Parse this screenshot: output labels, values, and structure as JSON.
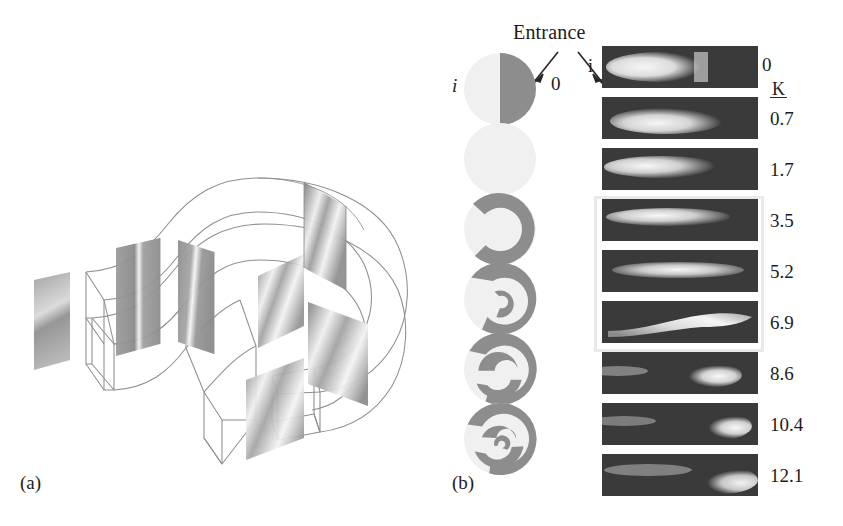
{
  "figure": {
    "background_color": "#ffffff",
    "ink_color": "#1c1c1c"
  },
  "panels": [
    {
      "id": "a",
      "label": "(a)",
      "caption_x": 20,
      "caption_y": 480
    },
    {
      "id": "b",
      "label": "(b)",
      "caption_x": 452,
      "caption_y": 480
    }
  ],
  "panel_a": {
    "name": "curved-duct-3d-wireframe",
    "description": "180 degree curved square duct wireframe with shaded cross-section planes",
    "wire_color": "#9a9a9a",
    "plane_fill_dark": "#8e8e8e",
    "plane_fill_mid": "#b4b4b4",
    "plane_fill_light": "#dcdcdc"
  },
  "panel_b": {
    "entrance_label": "Entrance",
    "arrow_left_target": "0",
    "arrow_right_target": "i",
    "circle_left_label": "i",
    "circle_right_label": "0",
    "strip_left_label": "i",
    "strip_right_label": "0",
    "k_header": "K",
    "k_header_underlined": true,
    "circles": [
      {
        "index": 0,
        "pattern": "half-disc",
        "top": 0
      },
      {
        "index": 1,
        "pattern": "crescent-c",
        "top": 70
      },
      {
        "index": 2,
        "pattern": "horseshoe",
        "top": 140
      },
      {
        "index": 3,
        "pattern": "spiral-open",
        "top": 210
      },
      {
        "index": 4,
        "pattern": "spiral-s",
        "top": 280
      },
      {
        "index": 5,
        "pattern": "spiral-double",
        "top": 350
      }
    ],
    "strips": [
      {
        "index": 0,
        "k": "0",
        "top": 0,
        "plume": "blunt-left",
        "highlighted": false
      },
      {
        "index": 1,
        "k": "0.7",
        "top": 51,
        "plume": "lens-left",
        "highlighted": false
      },
      {
        "index": 2,
        "k": "1.7",
        "top": 102,
        "plume": "tapered-left",
        "highlighted": false
      },
      {
        "index": 3,
        "k": "3.5",
        "top": 153,
        "plume": "long-streak",
        "highlighted": true
      },
      {
        "index": 4,
        "k": "5.2",
        "top": 204,
        "plume": "long-thin",
        "highlighted": true
      },
      {
        "index": 5,
        "k": "6.9",
        "top": 255,
        "plume": "rising-tail",
        "highlighted": true
      },
      {
        "index": 6,
        "k": "8.6",
        "top": 306,
        "plume": "bulb-right",
        "highlighted": false
      },
      {
        "index": 7,
        "k": "10.4",
        "top": 357,
        "plume": "bulb-far-right",
        "highlighted": false
      },
      {
        "index": 8,
        "k": "12.1",
        "top": 408,
        "plume": "diffuse-right",
        "highlighted": false
      }
    ],
    "highlight_box": {
      "top": 150,
      "height": 156,
      "border_color": "#e9e9e9"
    },
    "strip_background": "#3a3a3a",
    "strip_plume_color": "#f2f2f2"
  }
}
